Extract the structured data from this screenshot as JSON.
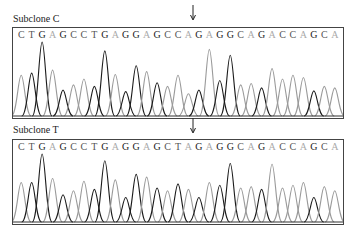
{
  "chart_data": [
    {
      "type": "line",
      "title": "Subclone C",
      "subtype": "DNA sequencing chromatogram",
      "sequence": [
        "C",
        "T",
        "G",
        "A",
        "G",
        "C",
        "C",
        "T",
        "G",
        "A",
        "G",
        "G",
        "A",
        "G",
        "C",
        "C",
        "A",
        "G",
        "A",
        "G",
        "G",
        "C",
        "A",
        "G",
        "A",
        "C",
        "C",
        "A",
        "G",
        "C",
        "A"
      ],
      "peak_heights": [
        0.55,
        0.58,
        1.0,
        0.62,
        0.35,
        0.42,
        0.5,
        0.4,
        0.88,
        0.56,
        0.33,
        0.68,
        0.6,
        0.45,
        0.4,
        0.55,
        0.3,
        0.35,
        0.9,
        0.48,
        0.82,
        0.42,
        0.44,
        0.38,
        0.64,
        0.5,
        0.55,
        0.52,
        0.34,
        0.4,
        0.38
      ],
      "variant_position": 16,
      "variant_base": "C",
      "grid": false
    },
    {
      "type": "line",
      "title": "Subclone T",
      "subtype": "DNA sequencing chromatogram",
      "sequence": [
        "C",
        "T",
        "G",
        "A",
        "G",
        "C",
        "C",
        "T",
        "G",
        "A",
        "G",
        "G",
        "A",
        "G",
        "C",
        "T",
        "A",
        "G",
        "A",
        "G",
        "G",
        "C",
        "A",
        "G",
        "A",
        "C",
        "C",
        "A",
        "G",
        "C",
        "A"
      ],
      "peak_heights": [
        0.58,
        0.58,
        1.0,
        0.64,
        0.4,
        0.46,
        0.6,
        0.48,
        0.9,
        0.62,
        0.36,
        0.7,
        0.66,
        0.5,
        0.46,
        0.56,
        0.48,
        0.36,
        0.58,
        0.54,
        0.86,
        0.5,
        0.52,
        0.48,
        0.85,
        0.5,
        0.54,
        0.58,
        0.36,
        0.52,
        0.46
      ],
      "variant_position": 16,
      "variant_base": "T",
      "grid": false
    }
  ],
  "panels": [
    {
      "label": "Subclone C"
    },
    {
      "label": "Subclone T"
    }
  ],
  "colors": {
    "dark_trace": "#1a1a1a",
    "light_trace": "#9a9a9a",
    "frame": "#444444"
  }
}
